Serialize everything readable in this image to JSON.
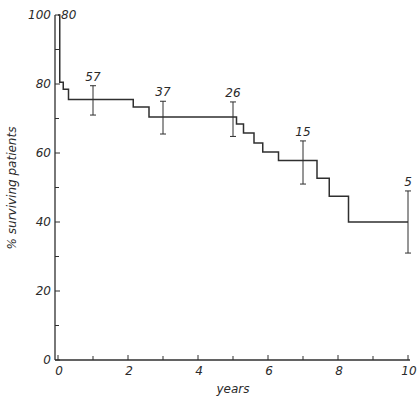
{
  "chart_data": {
    "type": "line",
    "subtype": "kaplan-meier-step",
    "title": "",
    "xlabel": "years",
    "ylabel": "% surviving patients",
    "xlim": [
      0,
      10
    ],
    "ylim": [
      0,
      100
    ],
    "x_ticks_labeled": [
      0,
      2,
      4,
      6,
      8,
      10
    ],
    "x_ticks_minor": [
      1,
      3,
      5,
      7,
      9
    ],
    "y_ticks_labeled": [
      0,
      20,
      40,
      60,
      80,
      100
    ],
    "y_ticks_minor": [
      10,
      30,
      50,
      70,
      90
    ],
    "grid": false,
    "legend": null,
    "series": [
      {
        "name": "survival",
        "steps": [
          {
            "x": 0.0,
            "y": 100
          },
          {
            "x": 0.05,
            "y": 80.5
          },
          {
            "x": 0.15,
            "y": 78.5
          },
          {
            "x": 0.3,
            "y": 75.5
          },
          {
            "x": 2.15,
            "y": 73.3
          },
          {
            "x": 2.6,
            "y": 70.4
          },
          {
            "x": 5.1,
            "y": 68.4
          },
          {
            "x": 5.3,
            "y": 65.8
          },
          {
            "x": 5.6,
            "y": 62.9
          },
          {
            "x": 5.85,
            "y": 60.3
          },
          {
            "x": 6.3,
            "y": 57.8
          },
          {
            "x": 7.4,
            "y": 52.7
          },
          {
            "x": 7.75,
            "y": 47.5
          },
          {
            "x": 8.3,
            "y": 40.0
          },
          {
            "x": 10.0,
            "y": 40.0
          }
        ]
      }
    ],
    "error_bars": [
      {
        "x": 1.0,
        "y": 75.5,
        "low": 71.0,
        "high": 79.5
      },
      {
        "x": 3.0,
        "y": 70.4,
        "low": 65.5,
        "high": 75.0
      },
      {
        "x": 5.0,
        "y": 70.4,
        "low": 64.8,
        "high": 74.8
      },
      {
        "x": 7.0,
        "y": 57.8,
        "low": 51.0,
        "high": 63.5
      },
      {
        "x": 10.0,
        "y": 40.0,
        "low": 31.0,
        "high": 49.0
      }
    ],
    "annotations": [
      {
        "x": 0.15,
        "y": 100,
        "text": "80",
        "note": "patients at risk"
      },
      {
        "x": 1.0,
        "y": 79.5,
        "text": "57"
      },
      {
        "x": 3.0,
        "y": 75.0,
        "text": "37"
      },
      {
        "x": 5.0,
        "y": 74.8,
        "text": "26"
      },
      {
        "x": 7.0,
        "y": 63.5,
        "text": "15"
      },
      {
        "x": 10.0,
        "y": 49.0,
        "text": "5"
      }
    ]
  },
  "labels": {
    "xlabel": "years",
    "ylabel": "% surviving patients"
  }
}
